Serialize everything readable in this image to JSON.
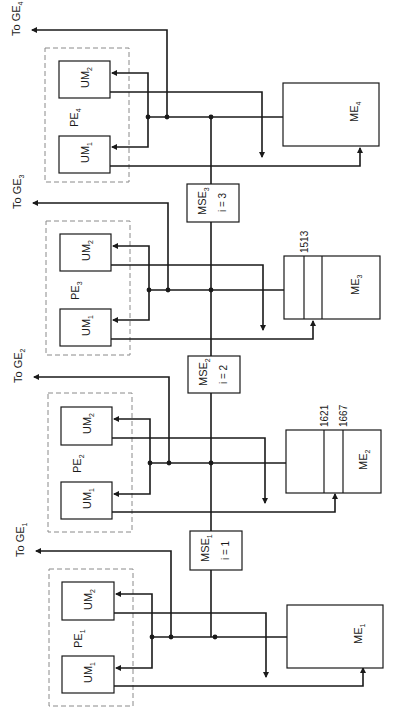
{
  "diagram": {
    "colors": {
      "line": "#1a1a1a",
      "dashed_box": "#8a8a8a",
      "background": "#ffffff"
    },
    "mse_bus_x": 211,
    "sections": [
      {
        "index": 4,
        "ge_label": "To GE",
        "ge_sub": "4",
        "pe_label": "PE",
        "pe_sub": "4",
        "um1_label": "UM",
        "um1_sub": "1",
        "um2_label": "UM",
        "um2_sub": "2",
        "me_label": "ME",
        "me_sub": "4",
        "me_dividers": [],
        "offset": 0
      },
      {
        "index": 3,
        "ge_label": "To GE",
        "ge_sub": "3",
        "pe_label": "PE",
        "pe_sub": "3",
        "um1_label": "UM",
        "um1_sub": "1",
        "um2_label": "UM",
        "um2_sub": "2",
        "me_label": "ME",
        "me_sub": "3",
        "me_dividers": [
          "1513"
        ],
        "offset": 173
      },
      {
        "index": 2,
        "ge_label": "To GE",
        "ge_sub": "2",
        "pe_label": "PE",
        "pe_sub": "2",
        "um1_label": "UM",
        "um1_sub": "1",
        "um2_label": "UM",
        "um2_sub": "2",
        "me_label": "ME",
        "me_sub": "2",
        "me_dividers": [
          "1621",
          "1667"
        ],
        "offset": 347
      },
      {
        "index": 1,
        "ge_label": "To GE",
        "ge_sub": "1",
        "pe_label": "PE",
        "pe_sub": "1",
        "um1_label": "UM",
        "um1_sub": "1",
        "um2_label": "UM",
        "um2_sub": "2",
        "me_label": "ME",
        "me_sub": "1",
        "me_dividers": [],
        "offset": 521
      }
    ],
    "switches": [
      {
        "label": "MSE",
        "sub": "3",
        "param": "i = 3"
      },
      {
        "label": "MSE",
        "sub": "2",
        "param": "i = 2"
      },
      {
        "label": "MSE",
        "sub": "1",
        "param": "i = 1"
      }
    ]
  }
}
